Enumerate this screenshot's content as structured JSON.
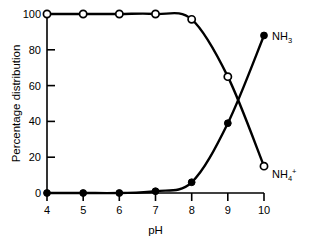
{
  "chart_data": {
    "type": "line",
    "title": "",
    "subtitle": "",
    "xlabel": "pH",
    "ylabel": "Percentage distribution",
    "x": [
      4,
      5,
      6,
      7,
      8,
      9,
      10
    ],
    "xlim": [
      4,
      10
    ],
    "ylim": [
      0,
      100
    ],
    "xticks": [
      "4",
      "5",
      "6",
      "7",
      "8",
      "9",
      "10"
    ],
    "yticks": [
      "0",
      "20",
      "40",
      "60",
      "80",
      "100"
    ],
    "xtick_values": [
      4,
      5,
      6,
      7,
      8,
      9,
      10
    ],
    "ytick_values": [
      0,
      20,
      40,
      60,
      80,
      100
    ],
    "grid": false,
    "legend_position": "right-of-curve-ends",
    "series": [
      {
        "name": "NH4+",
        "label_base": "NH",
        "label_sub": "4",
        "label_sup": "+",
        "marker": "open-circle",
        "color": "#000000",
        "values": [
          100,
          100,
          100,
          100,
          97,
          65,
          15
        ]
      },
      {
        "name": "NH3",
        "label_base": "NH",
        "label_sub": "3",
        "label_sup": "",
        "marker": "filled-circle",
        "color": "#000000",
        "values": [
          0,
          0,
          0,
          1,
          6,
          39,
          88
        ]
      }
    ],
    "annotations": [
      {
        "name": "crossover",
        "x": 9.25,
        "y": 52,
        "text": ""
      }
    ]
  },
  "axes": {
    "x_title": "pH",
    "y_title": "Percentage distribution",
    "x_tick_labels": [
      "4",
      "5",
      "6",
      "7",
      "8",
      "9",
      "10"
    ],
    "y_tick_labels": [
      "0",
      "20",
      "40",
      "60",
      "80",
      "100"
    ]
  },
  "labels": {
    "nh3": {
      "base": "NH",
      "sub": "3"
    },
    "nh4": {
      "base": "NH",
      "sub": "4",
      "sup": "+"
    }
  },
  "colors": {
    "ink": "#000000",
    "background": "#ffffff",
    "marker_fill_open": "#ffffff",
    "marker_fill_solid": "#000000"
  }
}
